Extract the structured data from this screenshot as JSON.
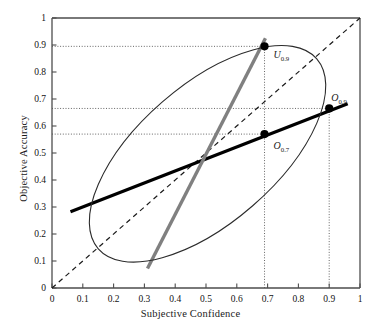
{
  "chart_data": {
    "type": "scatter",
    "title": "",
    "xlabel": "Subjective Confidence",
    "ylabel": "Objective Accuracy",
    "xlim": [
      0,
      1
    ],
    "ylim": [
      0,
      1
    ],
    "grid": false,
    "xticks": [
      "0",
      "0.1",
      "0.2",
      "0.3",
      "0.4",
      "0.5",
      "0.6",
      "0.7",
      "0.8",
      "0.9",
      "1"
    ],
    "xtick_values": [
      0,
      0.1,
      0.2,
      0.3,
      0.4,
      0.5,
      0.6,
      0.7,
      0.8,
      0.9,
      1
    ],
    "yticks": [
      "0",
      "0.1",
      "0.2",
      "0.3",
      "0.4",
      "0.5",
      "0.6",
      "0.7",
      "0.8",
      "0.9",
      "1"
    ],
    "ytick_values": [
      0,
      0.1,
      0.2,
      0.3,
      0.4,
      0.5,
      0.6,
      0.7,
      0.8,
      0.9,
      1
    ],
    "points": [
      {
        "name": "U",
        "subscript": "0.9",
        "x": 0.69,
        "y": 0.895,
        "label_dx": 9,
        "label_dy": 3
      },
      {
        "name": "O",
        "subscript": "0.9",
        "x": 0.9,
        "y": 0.665,
        "label_dx": 2,
        "label_dy": -16
      },
      {
        "name": "O",
        "subscript": "0.7",
        "x": 0.69,
        "y": 0.57,
        "label_dx": 9,
        "label_dy": 6
      }
    ],
    "series": [
      {
        "name": "identity-line",
        "type": "line",
        "style": "dashed",
        "color": "#1a1a1a",
        "x": [
          0.0,
          1.0
        ],
        "values": [
          0.0,
          1.0
        ]
      },
      {
        "name": "regression-line",
        "type": "line",
        "style": "solid-thick",
        "color": "#000000",
        "x": [
          0.06,
          0.96
        ],
        "values": [
          0.282,
          0.682
        ]
      },
      {
        "name": "steep-line",
        "type": "line",
        "style": "solid-thick",
        "color": "#808080",
        "x": [
          0.31,
          0.693
        ],
        "values": [
          0.072,
          0.925
        ]
      },
      {
        "name": "scatter-ellipse",
        "type": "ellipse",
        "style": "outline",
        "color": "#2b2b2b",
        "center": [
          0.505,
          0.497
        ],
        "semi_major": 0.47,
        "semi_minor": 0.255,
        "rotation_deg": -41
      }
    ],
    "reference_lines": [
      {
        "name": "h-ref-0.9",
        "orientation": "horizontal",
        "value": 0.895,
        "from": 0.0,
        "to": 0.69
      },
      {
        "name": "h-ref-0.665",
        "orientation": "horizontal",
        "value": 0.665,
        "from": 0.0,
        "to": 0.9
      },
      {
        "name": "h-ref-0.57",
        "orientation": "horizontal",
        "value": 0.57,
        "from": 0.0,
        "to": 0.69
      },
      {
        "name": "v-ref-0.69",
        "orientation": "vertical",
        "value": 0.69,
        "from": 0.0,
        "to": 0.895
      },
      {
        "name": "v-ref-0.90",
        "orientation": "vertical",
        "value": 0.9,
        "from": 0.0,
        "to": 0.665
      }
    ]
  },
  "colors": {
    "axis": "#4d4d4d",
    "ellipse": "#2b2b2b",
    "regression": "#000000",
    "steep": "#808080",
    "reference": "#555555",
    "point": "#000000",
    "background": "#ffffff"
  }
}
